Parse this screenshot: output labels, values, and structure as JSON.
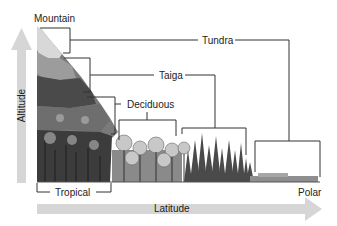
{
  "diagram": {
    "type": "biome-distribution",
    "labels": {
      "mountain": "Mountain",
      "tundra": "Tundra",
      "taiga": "Taiga",
      "deciduous": "Deciduous",
      "tropical": "Tropical",
      "polar": "Polar"
    },
    "axes": {
      "y_label": "Altitude",
      "x_label": "Latitude"
    },
    "colors": {
      "arrow": "#d4d4d4",
      "line": "#333333",
      "vegetation_dark": "#3a3a3a",
      "vegetation_light": "#9a9a9a"
    }
  }
}
